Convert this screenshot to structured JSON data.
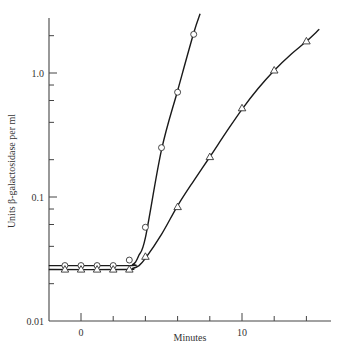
{
  "chart_data": {
    "type": "line",
    "title": "",
    "xlabel": "Minutes",
    "ylabel": "Units β-galactosidase per ml",
    "xlim": [
      -2,
      15.5
    ],
    "ylim": [
      0.01,
      3.0
    ],
    "yscale": "log",
    "grid": false,
    "legend": "none",
    "x_tick_labels": [
      {
        "value": 0,
        "label": "0"
      },
      {
        "value": 10,
        "label": "10"
      }
    ],
    "x_minor_ticks": [
      2,
      4,
      6,
      8,
      12,
      14
    ],
    "y_tick_labels": [
      {
        "value": 0.01,
        "label": "0.01"
      },
      {
        "value": 0.1,
        "label": "0.1"
      },
      {
        "value": 1.0,
        "label": "1.0"
      }
    ],
    "y_minor_ticks": [
      0.02,
      0.04,
      0.06,
      0.08,
      0.2,
      0.4,
      0.6,
      0.8,
      2.0
    ],
    "series": [
      {
        "name": "circles",
        "marker": "circle",
        "points": [
          {
            "x": -1,
            "y": 0.028
          },
          {
            "x": 0,
            "y": 0.028
          },
          {
            "x": 1,
            "y": 0.028
          },
          {
            "x": 2,
            "y": 0.028
          },
          {
            "x": 3,
            "y": 0.031
          },
          {
            "x": 4,
            "y": 0.057
          },
          {
            "x": 5,
            "y": 0.25
          },
          {
            "x": 6,
            "y": 0.7
          },
          {
            "x": 7,
            "y": 2.05
          }
        ],
        "curve": [
          {
            "x": -2,
            "y": 0.028
          },
          {
            "x": 3.0,
            "y": 0.028
          },
          {
            "x": 3.2,
            "y": 0.0285
          },
          {
            "x": 3.4,
            "y": 0.03
          },
          {
            "x": 3.6,
            "y": 0.034
          },
          {
            "x": 4,
            "y": 0.047
          },
          {
            "x": 5,
            "y": 0.24
          },
          {
            "x": 6,
            "y": 0.72
          },
          {
            "x": 7,
            "y": 2.1
          },
          {
            "x": 7.4,
            "y": 3.0
          }
        ]
      },
      {
        "name": "triangles",
        "marker": "triangle",
        "points": [
          {
            "x": -1,
            "y": 0.026
          },
          {
            "x": 0,
            "y": 0.026
          },
          {
            "x": 1,
            "y": 0.026
          },
          {
            "x": 2,
            "y": 0.026
          },
          {
            "x": 3,
            "y": 0.026
          },
          {
            "x": 4,
            "y": 0.033
          },
          {
            "x": 6,
            "y": 0.083
          },
          {
            "x": 8,
            "y": 0.21
          },
          {
            "x": 10,
            "y": 0.52
          },
          {
            "x": 12,
            "y": 1.05
          },
          {
            "x": 14,
            "y": 1.8
          }
        ],
        "curve": [
          {
            "x": -2,
            "y": 0.026
          },
          {
            "x": 2.8,
            "y": 0.026
          },
          {
            "x": 3.2,
            "y": 0.0265
          },
          {
            "x": 3.6,
            "y": 0.028
          },
          {
            "x": 4,
            "y": 0.032
          },
          {
            "x": 5,
            "y": 0.05
          },
          {
            "x": 6,
            "y": 0.085
          },
          {
            "x": 7,
            "y": 0.135
          },
          {
            "x": 8,
            "y": 0.21
          },
          {
            "x": 9,
            "y": 0.33
          },
          {
            "x": 10,
            "y": 0.51
          },
          {
            "x": 11,
            "y": 0.75
          },
          {
            "x": 12,
            "y": 1.05
          },
          {
            "x": 13,
            "y": 1.4
          },
          {
            "x": 14,
            "y": 1.8
          },
          {
            "x": 14.8,
            "y": 2.25
          }
        ]
      }
    ]
  }
}
